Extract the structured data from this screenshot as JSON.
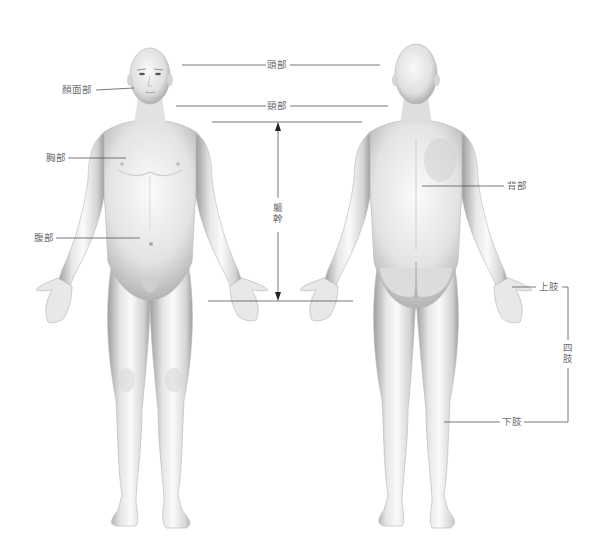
{
  "diagram": {
    "type": "anatomical-regions",
    "views": [
      "front",
      "back"
    ],
    "labels": {
      "head": "頭部",
      "face": "顏面部",
      "neck": "頸部",
      "chest": "胸部",
      "abdomen": "腹部",
      "trunk": "軀幹",
      "back": "背部",
      "upper_limb": "上肢",
      "lower_limb": "下肢",
      "limbs": "四肢"
    },
    "colors": {
      "skin_light": "#f4f4f4",
      "skin_mid": "#d9d9d9",
      "skin_dark": "#a8a8a8",
      "leader_line": "#555555",
      "label_text": "#6d6d6d"
    }
  }
}
